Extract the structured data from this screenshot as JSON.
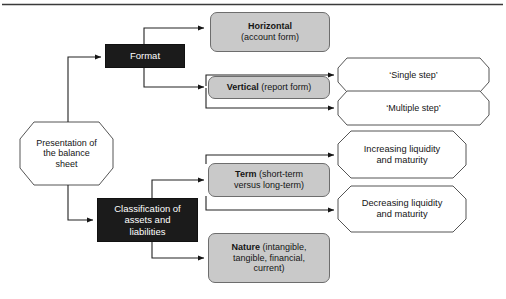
{
  "diagram": {
    "title": "Presentation of the balance sheet",
    "type": "flowchart",
    "frame": {
      "top_rule_color": "#3a3a3a"
    },
    "colors": {
      "dark_box_fill": "#1b1b1b",
      "dark_box_text": "#ffffff",
      "grey_box_fill": "#c9c9c9",
      "grey_box_border": "#6d6d6d",
      "octagon_fill": "#ffffff",
      "octagon_border": "#555555",
      "connector": "#222222"
    },
    "nodes": {
      "root": {
        "shape": "octagon",
        "lines": [
          "Presentation of",
          "the balance",
          "sheet"
        ]
      },
      "format": {
        "shape": "rect-dark",
        "label": "Format"
      },
      "classification": {
        "shape": "rect-dark",
        "lines": [
          "Classification of",
          "assets and",
          "liabilities"
        ]
      },
      "horizontal": {
        "shape": "rect-grey",
        "bold": "Horizontal",
        "rest": "(account form)"
      },
      "vertical": {
        "shape": "rect-grey",
        "bold": "Vertical",
        "rest": "(report form)"
      },
      "term": {
        "shape": "rect-grey",
        "bold": "Term",
        "rest": "(short-term",
        "line2": "versus long-term)"
      },
      "nature": {
        "shape": "rect-grey",
        "bold": "Nature",
        "rest": "(intangible,",
        "line2": "tangible, financial,",
        "line3": "current)"
      },
      "single_step": {
        "shape": "octagon",
        "label": "‘Single step’"
      },
      "multiple_step": {
        "shape": "octagon",
        "label": "‘Multiple step’"
      },
      "increasing": {
        "shape": "octagon",
        "line1": "Increasing liquidity",
        "line2": "and maturity"
      },
      "decreasing": {
        "shape": "octagon",
        "line1": "Decreasing liquidity",
        "line2": "and maturity"
      }
    },
    "edges": [
      {
        "from": "root",
        "to": "format"
      },
      {
        "from": "root",
        "to": "classification"
      },
      {
        "from": "format",
        "to": "horizontal"
      },
      {
        "from": "format",
        "to": "vertical"
      },
      {
        "from": "vertical",
        "to": "single_step"
      },
      {
        "from": "vertical",
        "to": "multiple_step"
      },
      {
        "from": "classification",
        "to": "term"
      },
      {
        "from": "classification",
        "to": "nature"
      },
      {
        "from": "term",
        "to": "increasing"
      },
      {
        "from": "term",
        "to": "decreasing"
      }
    ]
  }
}
